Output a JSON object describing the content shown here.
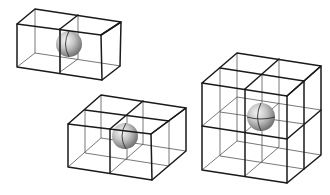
{
  "diagram": {
    "colors": {
      "background": "#ffffff",
      "edge": "#1a1a1a",
      "inner_edge": "#555555",
      "sphere_light": "#f4f4f4",
      "sphere_mid": "#b8b8b8",
      "sphere_dark": "#6e6e6e"
    },
    "figures": [
      {
        "id": "two-cubes",
        "label": "1×2×1 arrangement (two cubes side by side)",
        "cubes": 2,
        "sphere_position": "shared face center between two cubes"
      },
      {
        "id": "four-cubes",
        "label": "2×2×1 arrangement (four cubes in a layer)",
        "cubes": 4,
        "sphere_position": "shared edge of four cubes"
      },
      {
        "id": "eight-cubes",
        "label": "2×2×2 arrangement (eight cubes)",
        "cubes": 8,
        "sphere_position": "shared vertex of eight cubes"
      }
    ]
  }
}
